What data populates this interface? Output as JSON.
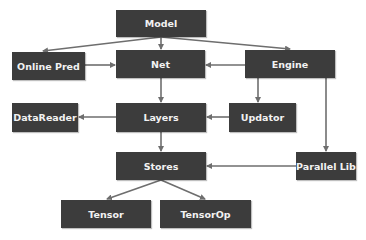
{
  "diagram": {
    "type": "architecture-block-diagram",
    "colors": {
      "node_fill": "#3c3c3c",
      "node_text": "#f2f2f2",
      "edge": "#6e6e6e",
      "background": "#ffffff"
    },
    "nodes": {
      "model": {
        "label": "Model",
        "x": 116,
        "y": 10,
        "w": 90,
        "h": 27
      },
      "online_pred": {
        "label": "Online Pred",
        "x": 12,
        "y": 52,
        "w": 73,
        "h": 28
      },
      "net": {
        "label": "Net",
        "x": 116,
        "y": 50,
        "w": 89,
        "h": 28
      },
      "engine": {
        "label": "Engine",
        "x": 245,
        "y": 50,
        "w": 90,
        "h": 28
      },
      "datareader": {
        "label": "DataReader",
        "x": 12,
        "y": 103,
        "w": 66,
        "h": 29
      },
      "layers": {
        "label": "Layers",
        "x": 116,
        "y": 103,
        "w": 90,
        "h": 29
      },
      "updator": {
        "label": "Updator",
        "x": 229,
        "y": 103,
        "w": 67,
        "h": 29
      },
      "stores": {
        "label": "Stores",
        "x": 116,
        "y": 152,
        "w": 90,
        "h": 28
      },
      "parallel_lib": {
        "label": "Parallel Lib",
        "x": 296,
        "y": 152,
        "w": 60,
        "h": 28
      },
      "tensor": {
        "label": "Tensor",
        "x": 61,
        "y": 200,
        "w": 90,
        "h": 28
      },
      "tensorop": {
        "label": "TensorOp",
        "x": 160,
        "y": 200,
        "w": 91,
        "h": 28
      }
    },
    "edges": [
      {
        "from": "Model",
        "to": "Online Pred"
      },
      {
        "from": "Model",
        "to": "Net"
      },
      {
        "from": "Model",
        "to": "Engine"
      },
      {
        "from": "Online Pred",
        "to": "Net"
      },
      {
        "from": "Engine",
        "to": "Net"
      },
      {
        "from": "Net",
        "to": "Layers"
      },
      {
        "from": "Engine",
        "to": "Updator"
      },
      {
        "from": "Engine",
        "to": "Parallel Lib"
      },
      {
        "from": "Layers",
        "to": "DataReader"
      },
      {
        "from": "Updator",
        "to": "Layers"
      },
      {
        "from": "Layers",
        "to": "Stores"
      },
      {
        "from": "Parallel Lib",
        "to": "Stores"
      },
      {
        "from": "Stores",
        "to": "Tensor"
      },
      {
        "from": "Stores",
        "to": "TensorOp"
      }
    ]
  }
}
